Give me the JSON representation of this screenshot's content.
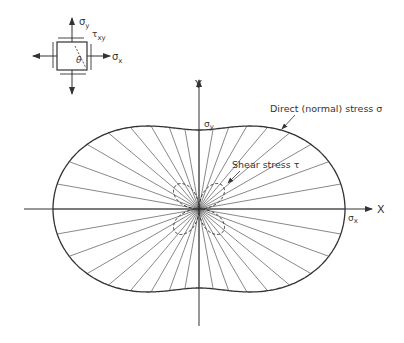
{
  "element": {
    "sigma_y": "σ",
    "sigma_y_sub": "y",
    "sigma_x": "σ",
    "sigma_x_sub": "x",
    "tau_xy": "τ",
    "tau_xy_sub": "xy",
    "theta": "θ"
  },
  "axes": {
    "y_label": "Y",
    "x_label": "X",
    "sigma_y_label": "σ",
    "sigma_y_sub": "y",
    "sigma_x_label": "σ",
    "sigma_x_sub": "x"
  },
  "annotations": {
    "direct_stress": "Direct (normal) stress σ",
    "shear_stress": "Shear stress τ"
  },
  "diagram": {
    "center": [
      199,
      209
    ],
    "sigma_x_radius": 146,
    "sigma_y_radius": 79,
    "ray_count": 36,
    "shear_lobe_scale": 0.26,
    "stroke_color": "#444444"
  }
}
